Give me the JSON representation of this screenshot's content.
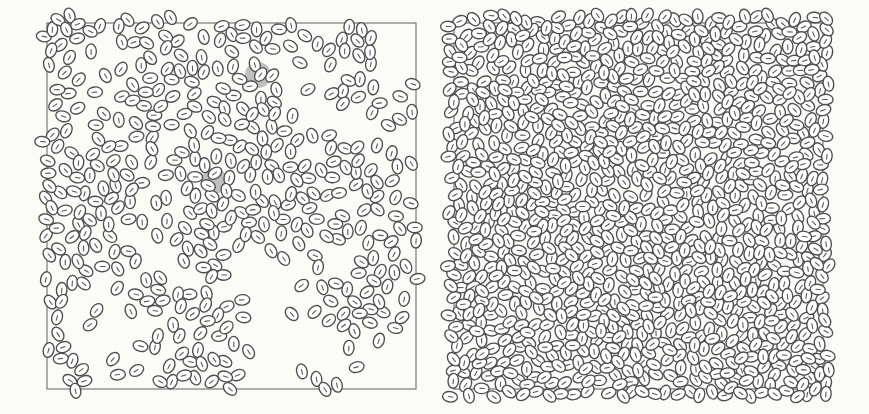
{
  "figure": {
    "background_color": "#fbfbf8",
    "stroke_color": "#4e4e4e",
    "frame_color": "#7a7a7a",
    "highlight_color": "#8e8e8e",
    "cell": {
      "length": 15,
      "width": 10.5
    },
    "panels": [
      {
        "id": "left",
        "label": "sparse clustered state",
        "frame": {
          "x": 47,
          "y": 23,
          "w": 369,
          "h": 366
        },
        "seed": 7,
        "count": 430,
        "background_fraction": 0.12,
        "highlights": [
          {
            "cx": 258,
            "cy": 75,
            "r": 13
          },
          {
            "cx": 214,
            "cy": 181,
            "r": 13
          }
        ],
        "clusters": [
          {
            "x": 60,
            "y": 30,
            "sx": 20,
            "sy": 8,
            "w": 14
          },
          {
            "x": 110,
            "y": 30,
            "sx": 25,
            "sy": 10,
            "w": 14
          },
          {
            "x": 160,
            "y": 30,
            "sx": 15,
            "sy": 12,
            "w": 14
          },
          {
            "x": 160,
            "y": 80,
            "sx": 20,
            "sy": 25,
            "w": 18
          },
          {
            "x": 145,
            "y": 120,
            "sx": 12,
            "sy": 20,
            "w": 12
          },
          {
            "x": 250,
            "y": 55,
            "sx": 28,
            "sy": 25,
            "w": 20
          },
          {
            "x": 245,
            "y": 110,
            "sx": 25,
            "sy": 10,
            "w": 10
          },
          {
            "x": 365,
            "y": 30,
            "sx": 10,
            "sy": 20,
            "w": 6
          },
          {
            "x": 385,
            "y": 110,
            "sx": 15,
            "sy": 10,
            "w": 8
          },
          {
            "x": 355,
            "y": 95,
            "sx": 12,
            "sy": 10,
            "w": 6
          },
          {
            "x": 60,
            "y": 80,
            "sx": 10,
            "sy": 15,
            "w": 6
          },
          {
            "x": 75,
            "y": 180,
            "sx": 25,
            "sy": 30,
            "w": 22
          },
          {
            "x": 60,
            "y": 270,
            "sx": 15,
            "sy": 50,
            "w": 22
          },
          {
            "x": 90,
            "y": 230,
            "sx": 25,
            "sy": 18,
            "w": 12
          },
          {
            "x": 160,
            "y": 170,
            "sx": 30,
            "sy": 15,
            "w": 16
          },
          {
            "x": 210,
            "y": 180,
            "sx": 25,
            "sy": 25,
            "w": 18
          },
          {
            "x": 195,
            "y": 220,
            "sx": 35,
            "sy": 12,
            "w": 14
          },
          {
            "x": 220,
            "y": 250,
            "sx": 15,
            "sy": 35,
            "w": 14
          },
          {
            "x": 285,
            "y": 180,
            "sx": 20,
            "sy": 25,
            "w": 16
          },
          {
            "x": 340,
            "y": 170,
            "sx": 30,
            "sy": 15,
            "w": 16
          },
          {
            "x": 300,
            "y": 230,
            "sx": 25,
            "sy": 15,
            "w": 14
          },
          {
            "x": 390,
            "y": 240,
            "sx": 15,
            "sy": 25,
            "w": 12
          },
          {
            "x": 355,
            "y": 300,
            "sx": 20,
            "sy": 12,
            "w": 14
          },
          {
            "x": 190,
            "y": 330,
            "sx": 25,
            "sy": 20,
            "w": 14
          },
          {
            "x": 205,
            "y": 375,
            "sx": 20,
            "sy": 10,
            "w": 10
          },
          {
            "x": 160,
            "y": 295,
            "sx": 20,
            "sy": 12,
            "w": 8
          },
          {
            "x": 80,
            "y": 365,
            "sx": 5,
            "sy": 10,
            "w": 3
          },
          {
            "x": 325,
            "y": 385,
            "sx": 8,
            "sy": 4,
            "w": 3
          }
        ]
      },
      {
        "id": "right",
        "label": "dense jammed state",
        "frame": {
          "x": 454,
          "y": 23,
          "w": 369,
          "h": 366
        },
        "seed": 19,
        "count": 1350,
        "background_fraction": 0.05,
        "highlights": [],
        "clusters": [
          {
            "x": 560,
            "y": 110,
            "sx": 95,
            "sy": 85,
            "w": 40
          },
          {
            "x": 640,
            "y": 200,
            "sx": 110,
            "sy": 80,
            "w": 40
          },
          {
            "x": 700,
            "y": 60,
            "sx": 70,
            "sy": 35,
            "w": 16
          },
          {
            "x": 520,
            "y": 260,
            "sx": 55,
            "sy": 80,
            "w": 18
          },
          {
            "x": 790,
            "y": 260,
            "sx": 25,
            "sy": 80,
            "w": 12
          },
          {
            "x": 640,
            "y": 320,
            "sx": 60,
            "sy": 50,
            "w": 18
          },
          {
            "x": 750,
            "y": 220,
            "sx": 40,
            "sy": 40,
            "w": 12
          },
          {
            "x": 800,
            "y": 60,
            "sx": 20,
            "sy": 30,
            "w": 5
          },
          {
            "x": 770,
            "y": 370,
            "sx": 20,
            "sy": 12,
            "w": 3
          },
          {
            "x": 470,
            "y": 375,
            "sx": 10,
            "sy": 8,
            "w": 2
          }
        ]
      }
    ]
  }
}
